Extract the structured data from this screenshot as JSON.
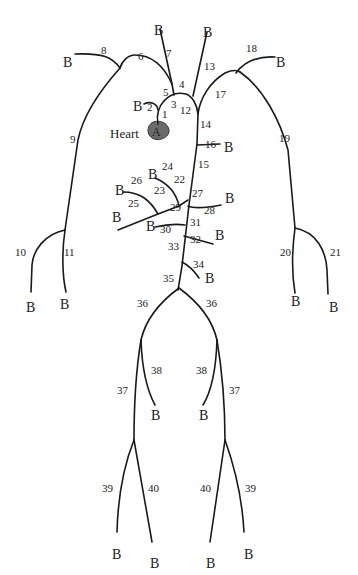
{
  "diagram": {
    "colors": {
      "stroke": "#1a1a1a",
      "heart_fill": "#6b6b6b",
      "text": "#222222"
    },
    "heart": {
      "label": "Heart",
      "letter": "A"
    },
    "boundary_label": "B",
    "segments": [
      {
        "id": "1",
        "x": 162,
        "y": 118
      },
      {
        "id": "2",
        "x": 147,
        "y": 111
      },
      {
        "id": "3",
        "x": 171,
        "y": 108
      },
      {
        "id": "4",
        "x": 179,
        "y": 88
      },
      {
        "id": "5",
        "x": 163,
        "y": 96
      },
      {
        "id": "6",
        "x": 138,
        "y": 60
      },
      {
        "id": "7",
        "x": 166,
        "y": 57
      },
      {
        "id": "8",
        "x": 101,
        "y": 54
      },
      {
        "id": "9",
        "x": 70,
        "y": 143
      },
      {
        "id": "10",
        "x": 15,
        "y": 256
      },
      {
        "id": "11",
        "x": 64,
        "y": 256
      },
      {
        "id": "12",
        "x": 180,
        "y": 114
      },
      {
        "id": "13",
        "x": 204,
        "y": 70
      },
      {
        "id": "14",
        "x": 200,
        "y": 128
      },
      {
        "id": "15",
        "x": 198,
        "y": 168
      },
      {
        "id": "16",
        "x": 205,
        "y": 148
      },
      {
        "id": "17",
        "x": 215,
        "y": 98
      },
      {
        "id": "18",
        "x": 246,
        "y": 52
      },
      {
        "id": "19",
        "x": 279,
        "y": 142
      },
      {
        "id": "20",
        "x": 280,
        "y": 256
      },
      {
        "id": "21",
        "x": 330,
        "y": 256
      },
      {
        "id": "22",
        "x": 174,
        "y": 183
      },
      {
        "id": "23",
        "x": 154,
        "y": 194
      },
      {
        "id": "24",
        "x": 162,
        "y": 170
      },
      {
        "id": "25",
        "x": 128,
        "y": 207
      },
      {
        "id": "26",
        "x": 131,
        "y": 184
      },
      {
        "id": "27",
        "x": 192,
        "y": 197
      },
      {
        "id": "28",
        "x": 204,
        "y": 214
      },
      {
        "id": "29",
        "x": 170,
        "y": 211
      },
      {
        "id": "30",
        "x": 160,
        "y": 233
      },
      {
        "id": "31",
        "x": 190,
        "y": 226
      },
      {
        "id": "32",
        "x": 190,
        "y": 243
      },
      {
        "id": "33",
        "x": 168,
        "y": 250
      },
      {
        "id": "34",
        "x": 193,
        "y": 268
      },
      {
        "id": "35",
        "x": 163,
        "y": 282
      },
      {
        "id": "36L",
        "label": "36",
        "x": 137,
        "y": 307
      },
      {
        "id": "36R",
        "label": "36",
        "x": 206,
        "y": 307
      },
      {
        "id": "37L",
        "label": "37",
        "x": 117,
        "y": 394
      },
      {
        "id": "37R",
        "label": "37",
        "x": 229,
        "y": 394
      },
      {
        "id": "38L",
        "label": "38",
        "x": 151,
        "y": 374
      },
      {
        "id": "38R",
        "label": "38",
        "x": 196,
        "y": 374
      },
      {
        "id": "39L",
        "label": "39",
        "x": 102,
        "y": 492
      },
      {
        "id": "39R",
        "label": "39",
        "x": 245,
        "y": 492
      },
      {
        "id": "40L",
        "label": "40",
        "x": 148,
        "y": 492
      },
      {
        "id": "40R",
        "label": "40",
        "x": 200,
        "y": 492
      }
    ],
    "boundaries": [
      {
        "id": "B2",
        "x": 133,
        "y": 111
      },
      {
        "id": "B7",
        "x": 154,
        "y": 35
      },
      {
        "id": "B8",
        "x": 63,
        "y": 67
      },
      {
        "id": "B13",
        "x": 203,
        "y": 37
      },
      {
        "id": "B10",
        "x": 26,
        "y": 312
      },
      {
        "id": "B11",
        "x": 60,
        "y": 309
      },
      {
        "id": "B16",
        "x": 224,
        "y": 152
      },
      {
        "id": "B18",
        "x": 276,
        "y": 67
      },
      {
        "id": "B20",
        "x": 291,
        "y": 306
      },
      {
        "id": "B21",
        "x": 329,
        "y": 312
      },
      {
        "id": "B24",
        "x": 148,
        "y": 179
      },
      {
        "id": "B26",
        "x": 115,
        "y": 195
      },
      {
        "id": "B25",
        "x": 112,
        "y": 222
      },
      {
        "id": "B28",
        "x": 225,
        "y": 203
      },
      {
        "id": "B30",
        "x": 146,
        "y": 231
      },
      {
        "id": "B32",
        "x": 215,
        "y": 240
      },
      {
        "id": "B34",
        "x": 205,
        "y": 283
      },
      {
        "id": "B38L",
        "x": 151,
        "y": 420
      },
      {
        "id": "B38R",
        "x": 199,
        "y": 420
      },
      {
        "id": "B39L",
        "x": 112,
        "y": 559
      },
      {
        "id": "B40L",
        "x": 150,
        "y": 568
      },
      {
        "id": "B40R",
        "x": 206,
        "y": 568
      },
      {
        "id": "B39R",
        "x": 244,
        "y": 559
      }
    ]
  }
}
